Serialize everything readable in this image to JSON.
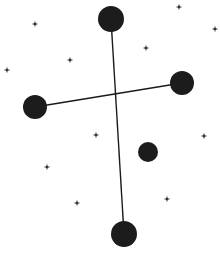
{
  "diagram": {
    "type": "constellation-chart",
    "background_color": "#ffffff",
    "line_color": "#1a1a1a",
    "major_star_color": "#1c1c1c",
    "minor_star_color": "#222222",
    "major_stars": [
      {
        "id": "top",
        "cx": 111,
        "cy": 19,
        "r": 13
      },
      {
        "id": "right",
        "cx": 182,
        "cy": 83,
        "r": 12
      },
      {
        "id": "left",
        "cx": 35,
        "cy": 107,
        "r": 12
      },
      {
        "id": "middle",
        "cx": 148,
        "cy": 152,
        "r": 10
      },
      {
        "id": "bottom",
        "cx": 124,
        "cy": 234,
        "r": 13
      }
    ],
    "lines": [
      {
        "from": "top",
        "to": "bottom",
        "x1": 111,
        "y1": 19,
        "x2": 124,
        "y2": 234
      },
      {
        "from": "left",
        "to": "right",
        "x1": 35,
        "y1": 107,
        "x2": 182,
        "y2": 83
      }
    ],
    "minor_stars": [
      {
        "x": 35,
        "y": 24
      },
      {
        "x": 179,
        "y": 7
      },
      {
        "x": 215,
        "y": 29
      },
      {
        "x": 146,
        "y": 48
      },
      {
        "x": 70,
        "y": 60
      },
      {
        "x": 7,
        "y": 70
      },
      {
        "x": 96,
        "y": 135
      },
      {
        "x": 204,
        "y": 136
      },
      {
        "x": 47,
        "y": 167
      },
      {
        "x": 167,
        "y": 199
      },
      {
        "x": 77,
        "y": 203
      }
    ]
  },
  "caption": {
    "text": ""
  }
}
